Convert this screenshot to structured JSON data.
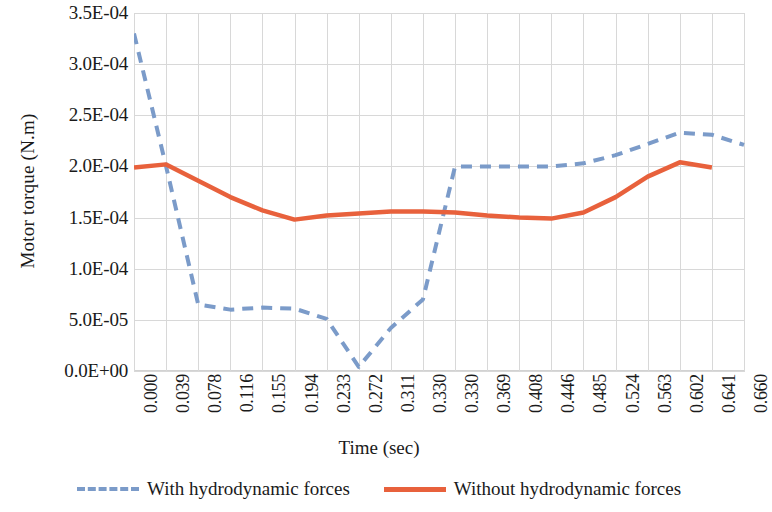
{
  "chart_data": {
    "type": "line",
    "title": "",
    "xlabel": "Time (sec)",
    "ylabel": "Motor torque (N.m)",
    "xlim": [
      0,
      19
    ],
    "ylim": [
      0,
      0.00035
    ],
    "grid": true,
    "legend_position": "bottom-center",
    "x_tick_labels": [
      "0.000",
      "0.039",
      "0.078",
      "0.116",
      "0.155",
      "0.194",
      "0.233",
      "0.272",
      "0.311",
      "0.330",
      "0.330",
      "0.369",
      "0.408",
      "0.446",
      "0.485",
      "0.524",
      "0.563",
      "0.602",
      "0.641",
      "0.660"
    ],
    "y_tick_labels": [
      "0.0E+00",
      "5.0E-05",
      "1.0E-04",
      "1.5E-04",
      "2.0E-04",
      "2.5E-04",
      "3.0E-04",
      "3.5E-04"
    ],
    "y_tick_values": [
      0,
      5e-05,
      0.0001,
      0.00015,
      0.0002,
      0.00025,
      0.0003,
      0.00035
    ],
    "series": [
      {
        "name": "With hydrodynamic forces",
        "color": "#7b9bc9",
        "style": "dashed",
        "values": [
          0.00033,
          0.0002,
          6.5e-05,
          6e-05,
          6.2e-05,
          6.1e-05,
          5.1e-05,
          4e-06,
          4.2e-05,
          7e-05,
          0.0002,
          0.0002,
          0.0002,
          0.0002,
          0.000203,
          0.000211,
          0.000222,
          0.000233,
          0.000231,
          0.000221
        ]
      },
      {
        "name": "Without hydrodynamic forces",
        "color": "#e8613c",
        "style": "solid",
        "values": [
          0.000199,
          0.000202,
          0.000186,
          0.00017,
          0.000157,
          0.000148,
          0.000152,
          0.000154,
          0.000156,
          0.000156,
          0.000155,
          0.000152,
          0.00015,
          0.000149,
          0.000155,
          0.00017,
          0.00019,
          0.000204,
          0.000199,
          null
        ]
      }
    ]
  },
  "legend": {
    "items": [
      {
        "label": "With hydrodynamic forces"
      },
      {
        "label": "Without hydrodynamic forces"
      }
    ]
  }
}
